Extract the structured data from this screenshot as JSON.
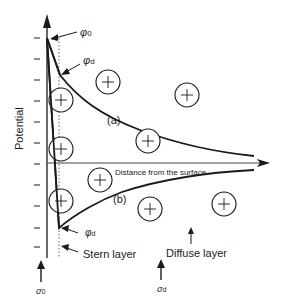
{
  "diagram": {
    "axes": {
      "y_label": "Potential",
      "x_label": "Distance from  the surface"
    },
    "labels": {
      "phi0": "φ",
      "phi0_sub": "0",
      "phid_top": "φ",
      "phid_top_sub": "d",
      "phid_bottom": "φ",
      "phid_bottom_sub": "d",
      "curve_a": "(a)",
      "curve_b": "(b)",
      "stern_layer": "Stern  layer",
      "diffuse_layer": "Diffuse layer",
      "sigma0": "σ",
      "sigma0_sub": "0",
      "sigmad": "σ",
      "sigmad_sub": "d"
    },
    "ions": [
      {
        "charge": "+",
        "x": 61,
        "y": 100
      },
      {
        "charge": "+",
        "x": 61,
        "y": 149
      },
      {
        "charge": "+",
        "x": 61,
        "y": 201
      },
      {
        "charge": "+",
        "x": 108,
        "y": 82
      },
      {
        "charge": "+",
        "x": 187,
        "y": 95
      },
      {
        "charge": "+",
        "x": 148,
        "y": 141
      },
      {
        "charge": "+",
        "x": 100,
        "y": 180
      },
      {
        "charge": "+",
        "x": 150,
        "y": 209
      },
      {
        "charge": "+",
        "x": 224,
        "y": 204
      }
    ],
    "colors": {
      "ink": "#1a1a1a",
      "background": "#ffffff"
    }
  }
}
